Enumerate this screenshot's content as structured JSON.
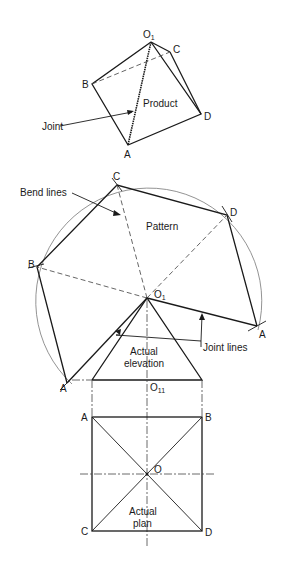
{
  "diagram": {
    "views": {
      "product": {
        "label": "Product",
        "joint_label": "Joint",
        "points": {
          "O1": {
            "label": "O",
            "sub": "1"
          },
          "A": {
            "label": "A"
          },
          "B": {
            "label": "B"
          },
          "C": {
            "label": "C"
          },
          "D": {
            "label": "D"
          }
        }
      },
      "pattern": {
        "label": "Pattern",
        "bend_lines_label": "Bend lines",
        "joint_lines_label": "Joint lines",
        "points": {
          "O1": {
            "label": "O",
            "sub": "1"
          },
          "A_left": {
            "label": "A"
          },
          "A_right": {
            "label": "A"
          },
          "B": {
            "label": "B"
          },
          "C": {
            "label": "C"
          },
          "D": {
            "label": "D"
          }
        }
      },
      "elevation": {
        "label_line1": "Actual",
        "label_line2": "elevation",
        "base_point": {
          "label": "O",
          "sub": "11"
        }
      },
      "plan": {
        "label_line1": "Actual",
        "label_line2": "plan",
        "points": {
          "A": {
            "label": "A"
          },
          "B": {
            "label": "B"
          },
          "C": {
            "label": "C"
          },
          "D": {
            "label": "D"
          },
          "O": {
            "label": "O"
          }
        }
      }
    }
  }
}
